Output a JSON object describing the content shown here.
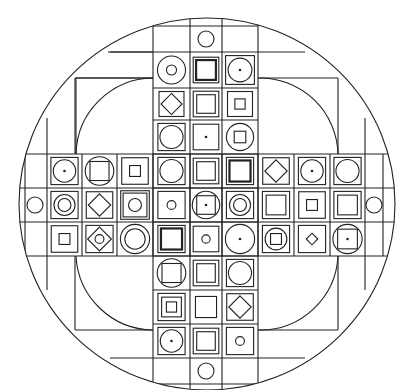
{
  "figure": {
    "stroke_color": "#222222",
    "background_color": "#ffffff",
    "outer_circle": {
      "cx": 207,
      "cy": 204,
      "rx": 188,
      "ry": 186
    },
    "inner_arc_radius": 140
  },
  "grid": {
    "cross_cols_x": [
      153,
      190,
      222,
      258
    ],
    "cross_rows_y": [
      52,
      88,
      120,
      154,
      188,
      222,
      256,
      290,
      324,
      358
    ],
    "arm_cols_x": [
      47,
      82,
      117,
      153,
      190,
      222,
      258,
      294,
      330,
      365
    ],
    "arm_rows_y": [
      154,
      188,
      222,
      256
    ],
    "cap_top_y": 26,
    "cap_bottom_y": 384,
    "cap_left_x": 25,
    "cap_right_x": 383
  },
  "end_caps": [
    {
      "name": "top-cap",
      "shape": "circle",
      "cx": 206,
      "cy": 39,
      "r": 8
    },
    {
      "name": "bottom-cap",
      "shape": "circle",
      "cx": 206,
      "cy": 371,
      "r": 8
    },
    {
      "name": "left-cap",
      "shape": "circle",
      "cx": 35,
      "cy": 205,
      "r": 8
    },
    {
      "name": "right-cap",
      "shape": "circle",
      "cx": 374,
      "cy": 205,
      "r": 8
    }
  ],
  "tiles": [
    {
      "row": 0,
      "col": 1,
      "motif": "circle-ring-small-circle"
    },
    {
      "row": 0,
      "col": 2,
      "motif": "square-thick-square"
    },
    {
      "row": 0,
      "col": 3,
      "motif": "square-circle-dot"
    },
    {
      "row": 1,
      "col": 1,
      "motif": "square-diamond"
    },
    {
      "row": 1,
      "col": 2,
      "motif": "square-square"
    },
    {
      "row": 1,
      "col": 3,
      "motif": "square-small-square"
    },
    {
      "row": 2,
      "col": 1,
      "motif": "square-circle"
    },
    {
      "row": 2,
      "col": 2,
      "motif": "square-dot"
    },
    {
      "row": 2,
      "col": 3,
      "motif": "circle-small-square"
    },
    {
      "row": 3,
      "col": "a0",
      "motif": "square-circle-dot"
    },
    {
      "row": 3,
      "col": "a1",
      "motif": "circle-square"
    },
    {
      "row": 3,
      "col": "a2",
      "motif": "square-small-square"
    },
    {
      "row": 3,
      "col": "a3",
      "motif": "square-circle"
    },
    {
      "row": 3,
      "col": "a4",
      "motif": "square-square"
    },
    {
      "row": 3,
      "col": "a5",
      "motif": "square-thick-square"
    },
    {
      "row": 3,
      "col": "a6",
      "motif": "square-diamond"
    },
    {
      "row": 3,
      "col": "a7",
      "motif": "square-circle-dot"
    },
    {
      "row": 3,
      "col": "a8",
      "motif": "square-circle"
    },
    {
      "row": 4,
      "col": "a0",
      "motif": "square-double-circle"
    },
    {
      "row": 4,
      "col": "a1",
      "motif": "square-diamond"
    },
    {
      "row": 4,
      "col": "a2",
      "motif": "double-square-circle"
    },
    {
      "row": 4,
      "col": "a3",
      "motif": "square-small-circle"
    },
    {
      "row": 4,
      "col": "a4",
      "motif": "circle-square-dot"
    },
    {
      "row": 4,
      "col": "a5",
      "motif": "square-double-circle"
    },
    {
      "row": 4,
      "col": "a6",
      "motif": "square-square"
    },
    {
      "row": 4,
      "col": "a7",
      "motif": "square-small-square"
    },
    {
      "row": 4,
      "col": "a8",
      "motif": "square-square"
    },
    {
      "row": 5,
      "col": "a0",
      "motif": "square-small-square"
    },
    {
      "row": 5,
      "col": "a1",
      "motif": "square-diamond-circle"
    },
    {
      "row": 5,
      "col": "a2",
      "motif": "circle-ring"
    },
    {
      "row": 5,
      "col": "a3",
      "motif": "square-thick-square"
    },
    {
      "row": 5,
      "col": "a4",
      "motif": "square-small-circle"
    },
    {
      "row": 5,
      "col": "a5",
      "motif": "circle-dot"
    },
    {
      "row": 5,
      "col": "a6",
      "motif": "square-circle-small-square"
    },
    {
      "row": 5,
      "col": "a7",
      "motif": "square-small-diamond"
    },
    {
      "row": 5,
      "col": "a8",
      "motif": "circle-square-dot"
    },
    {
      "row": 6,
      "col": 1,
      "motif": "circle-square"
    },
    {
      "row": 6,
      "col": 2,
      "motif": "square-square"
    },
    {
      "row": 6,
      "col": 3,
      "motif": "square-circle"
    },
    {
      "row": 7,
      "col": 1,
      "motif": "square-square-small-square"
    },
    {
      "row": 7,
      "col": 2,
      "motif": "square-plain"
    },
    {
      "row": 7,
      "col": 3,
      "motif": "square-diamond"
    },
    {
      "row": 8,
      "col": 1,
      "motif": "square-circle-dot"
    },
    {
      "row": 8,
      "col": 2,
      "motif": "square-square"
    },
    {
      "row": 8,
      "col": 3,
      "motif": "square-small-circle"
    }
  ]
}
